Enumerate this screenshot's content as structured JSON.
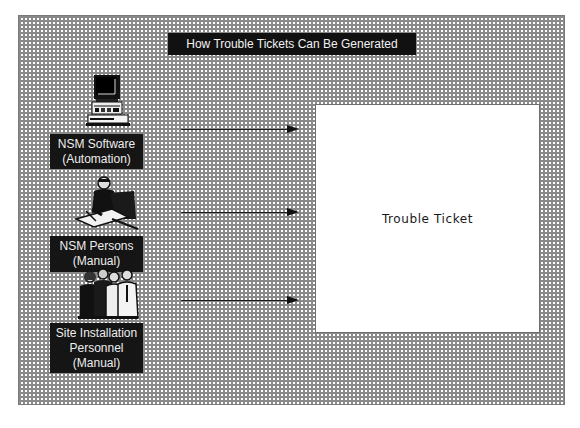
{
  "title": "How Trouble Tickets Can Be Generated",
  "sources": [
    {
      "id": "nsm-software",
      "icon": "computer-icon",
      "lines": [
        "NSM Software",
        "(Automation)"
      ]
    },
    {
      "id": "nsm-persons",
      "icon": "person-at-desk-icon",
      "lines": [
        "NSM Persons",
        "(Manual)"
      ]
    },
    {
      "id": "site-installation-personnel",
      "icon": "group-of-people-icon",
      "lines": [
        "Site Installation",
        "Personnel",
        "(Manual)"
      ]
    }
  ],
  "target": {
    "label": "Trouble Ticket"
  },
  "colors": {
    "label_bg": "#151515",
    "label_text": "#eeeeee",
    "pattern": "#8a8a8a",
    "ticket_bg": "#ffffff"
  }
}
